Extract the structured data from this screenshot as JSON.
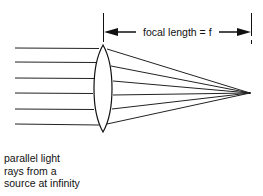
{
  "dimension": {
    "label": "focal length = f"
  },
  "caption": {
    "lines": [
      "parallel light",
      "rays from a",
      "source at infinity"
    ]
  },
  "colors": {
    "ink": "#111111",
    "background": "#ffffff"
  }
}
